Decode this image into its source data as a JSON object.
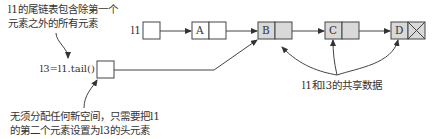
{
  "diagram": {
    "type": "linked-list-tail-sharing",
    "annotations": {
      "top_left_line1": "l1的尾链表包含除第一个",
      "top_left_line2": "元素之外的所有元素",
      "bottom_left_line1": "无须分配任何新空间，只需要把l1",
      "bottom_left_line2": "的第二个元素设置为l3的头元素",
      "shared": "l1和l3的共享数据"
    },
    "variables": {
      "l1": "l1",
      "l3": "l3=l1.tail()"
    },
    "nodes": [
      {
        "id": "A",
        "label": "A",
        "shared": false
      },
      {
        "id": "B",
        "label": "B",
        "shared": true
      },
      {
        "id": "C",
        "label": "C",
        "shared": true
      },
      {
        "id": "D",
        "label": "D",
        "shared": true,
        "terminal": true
      }
    ],
    "colors": {
      "shared_fill": "#d9d9d9",
      "plain_fill": "#ffffff",
      "stroke": "#444444"
    }
  }
}
